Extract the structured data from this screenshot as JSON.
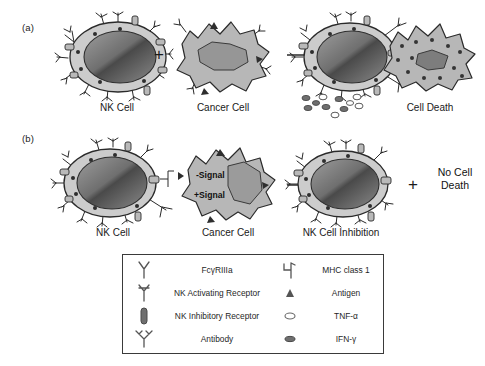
{
  "figure": {
    "panels": [
      {
        "id": "a",
        "label": "(a)",
        "captions": [
          "NK Cell",
          "Cancer Cell",
          "Cell Death"
        ],
        "operator_plus": "+",
        "arrow": "→"
      },
      {
        "id": "b",
        "label": "(b)",
        "captions": [
          "NK Cell",
          "Cancer Cell",
          "NK Cell Inhibition"
        ],
        "operator_plus": "+",
        "arrow": "→",
        "signals": [
          "-Signal",
          "+Signal"
        ],
        "outcome": [
          "No Cell",
          "Death"
        ]
      }
    ]
  },
  "legend": {
    "rows": [
      {
        "left_icon": "fc-gamma-r3a-icon",
        "left_label": "FcγRIIIa",
        "right_icon": "mhc-class-1-icon",
        "right_label": "MHC class 1"
      },
      {
        "left_icon": "nk-activating-receptor-icon",
        "left_label": "NK Activating Receptor",
        "right_icon": "antigen-icon",
        "right_label": "Antigen"
      },
      {
        "left_icon": "nk-inhibitory-receptor-icon",
        "left_label": "NK Inhibitory Receptor",
        "right_icon": "tnf-alpha-icon",
        "right_label": "TNF-α"
      },
      {
        "left_icon": "antibody-icon",
        "left_label": "Antibody",
        "right_icon": "ifn-gamma-icon",
        "right_label": "IFN-γ"
      }
    ]
  },
  "colors": {
    "cell_membrane": "#c9c9c9",
    "nucleus_dark": "#555555",
    "nucleus_light": "#9a9a9a",
    "cancer_body": "#b4b4b4",
    "cancer_nucleus": "#8e8e8e",
    "outline": "#2a2a2a",
    "legend_border": "#3a3a3a",
    "text": "#1a1a1a"
  }
}
